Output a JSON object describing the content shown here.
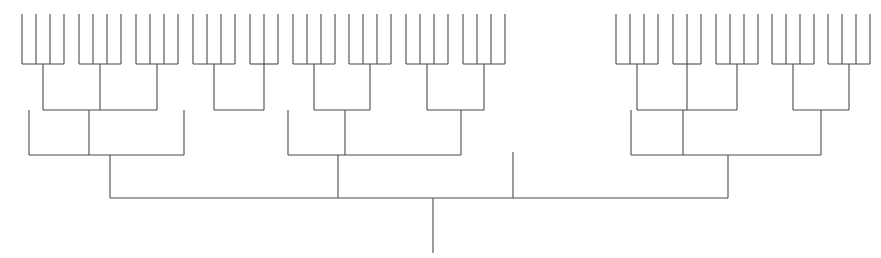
{
  "figure": {
    "kind": "dendrogram",
    "title": "",
    "background_color": "#ffffff",
    "line_color": "#4a4a4a",
    "line_width": 1.1,
    "width": 881,
    "height": 258,
    "orientation": "top-down-leaves-up",
    "axis_visible": false,
    "labels_visible": false,
    "tick_labels": []
  },
  "chart_data": {
    "type": "dendrogram",
    "title": "",
    "xlabel": "",
    "ylabel": "",
    "grid": false,
    "legend": null,
    "n_leaves": 56,
    "leaf_top_y": 14,
    "root_bottom_y": 253,
    "tier_levels": {
      "leaf_top": 14,
      "tier1_merge": 64,
      "tier2_merge": 110,
      "tier3_merge": 155,
      "root_merge": 198
    },
    "leaves_x": [
      22,
      36,
      50,
      64,
      79,
      93,
      107,
      121,
      136,
      150,
      164,
      178,
      193,
      207,
      221,
      235,
      250,
      264,
      278,
      293,
      307,
      321,
      335,
      349,
      363,
      377,
      391,
      406,
      420,
      434,
      448,
      463,
      477,
      491,
      505,
      513,
      616,
      630,
      644,
      658,
      673,
      687,
      701,
      716,
      730,
      744,
      758,
      772,
      786,
      800,
      814,
      828,
      842,
      856,
      870
    ],
    "tier1_clusters": [
      {
        "id": "t1-a",
        "x_start": 22,
        "x_end": 64,
        "y": 64,
        "stem_x": 43,
        "n_leaves": 4
      },
      {
        "id": "t1-b",
        "x_start": 79,
        "x_end": 121,
        "y": 64,
        "stem_x": 100,
        "n_leaves": 4
      },
      {
        "id": "t1-c",
        "x_start": 136,
        "x_end": 178,
        "y": 64,
        "stem_x": 157,
        "n_leaves": 4
      },
      {
        "id": "t1-d",
        "x_start": 193,
        "x_end": 235,
        "y": 64,
        "stem_x": 214,
        "n_leaves": 4
      },
      {
        "id": "t1-e",
        "x_start": 250,
        "x_end": 278,
        "y": 64,
        "stem_x": 264,
        "n_leaves": 3
      },
      {
        "id": "t1-f",
        "x_start": 293,
        "x_end": 335,
        "y": 64,
        "stem_x": 314,
        "n_leaves": 4
      },
      {
        "id": "t1-g",
        "x_start": 349,
        "x_end": 391,
        "y": 64,
        "stem_x": 370,
        "n_leaves": 4
      },
      {
        "id": "t1-h",
        "x_start": 406,
        "x_end": 448,
        "y": 64,
        "stem_x": 427,
        "n_leaves": 4
      },
      {
        "id": "t1-i",
        "x_start": 463,
        "x_end": 505,
        "y": 64,
        "stem_x": 484,
        "n_leaves": 4
      },
      {
        "id": "t1-j",
        "x_start": 616,
        "x_end": 658,
        "y": 64,
        "stem_x": 637,
        "n_leaves": 4
      },
      {
        "id": "t1-k",
        "x_start": 673,
        "x_end": 701,
        "y": 64,
        "stem_x": 687,
        "n_leaves": 3
      },
      {
        "id": "t1-l",
        "x_start": 716,
        "x_end": 758,
        "y": 64,
        "stem_x": 737,
        "n_leaves": 4
      },
      {
        "id": "t1-m",
        "x_start": 772,
        "x_end": 814,
        "y": 64,
        "stem_x": 793,
        "n_leaves": 4
      },
      {
        "id": "t1-n",
        "x_start": 828,
        "x_end": 870,
        "y": 64,
        "stem_x": 849,
        "n_leaves": 4
      }
    ],
    "tier2_clusters": [
      {
        "id": "t2-a",
        "y": 110,
        "stem_x": 89,
        "children_x": [
          43,
          100,
          157
        ],
        "extra_drops": []
      },
      {
        "id": "t2-b",
        "y": 110,
        "stem_x": 184,
        "children_x": [
          214,
          264
        ],
        "extra_drops": []
      },
      {
        "id": "t2-c",
        "y": 110,
        "stem_x": 345,
        "children_x": [
          314,
          370
        ],
        "extra_drops": []
      },
      {
        "id": "t2-d",
        "y": 110,
        "stem_x": 461,
        "children_x": [
          427,
          484
        ],
        "extra_drops": []
      },
      {
        "id": "t2-e",
        "y": 110,
        "stem_x": 683,
        "children_x": [
          637,
          687,
          737
        ],
        "extra_drops": []
      },
      {
        "id": "t2-f",
        "y": 110,
        "stem_x": 821,
        "children_x": [
          793,
          849
        ],
        "extra_drops": []
      }
    ],
    "tier3_clusters": [
      {
        "id": "t3-left",
        "y": 155,
        "stem_x": 110,
        "children_x": [
          29,
          89,
          184
        ]
      },
      {
        "id": "t3-middle",
        "y": 155,
        "stem_x": 338,
        "children_x": [
          288,
          345,
          461
        ]
      },
      {
        "id": "t3-right",
        "y": 155,
        "stem_x": 728,
        "children_x": [
          631,
          683,
          821
        ]
      }
    ],
    "singleton_leaves": [
      {
        "id": "s-left",
        "x": 29,
        "y_top": 110,
        "y_bottom": 155
      },
      {
        "id": "s-mid",
        "x": 288,
        "y_top": 110,
        "y_bottom": 155
      },
      {
        "id": "s-right",
        "x": 631,
        "y_top": 110,
        "y_bottom": 155
      },
      {
        "id": "s-center",
        "x": 513,
        "y_top": 152,
        "y_bottom": 198
      }
    ],
    "root": {
      "id": "root",
      "y": 198,
      "x_start": 110,
      "x_end": 728,
      "stem_x": 433,
      "stem_y_bottom": 253,
      "children_x": [
        110,
        338,
        513,
        728
      ]
    }
  }
}
